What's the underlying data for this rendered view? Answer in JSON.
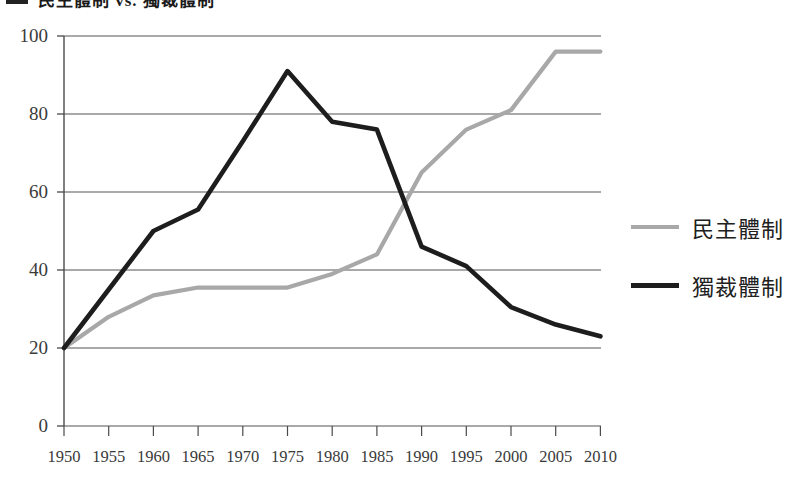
{
  "figure": {
    "title_partial": "民主體制 vs. 獨裁體制",
    "figure_marker": ""
  },
  "legend": {
    "position": "right",
    "entries": [
      {
        "label": "民主體制",
        "color": "#a8a8a8",
        "style": "gray"
      },
      {
        "label": "獨裁體制",
        "color": "#1d1d1d",
        "style": "black"
      }
    ]
  },
  "axes": {
    "y_ticks": [
      "100",
      "80",
      "60",
      "40",
      "20",
      "0"
    ],
    "x_ticks": [
      "1950",
      "1955",
      "1960",
      "1965",
      "1970",
      "1975",
      "1980",
      "1985",
      "1990",
      "1995",
      "2000",
      "2005",
      "2010"
    ]
  },
  "chart_data": {
    "type": "line",
    "title": "民主體制 vs. 獨裁體制",
    "xlabel": "",
    "ylabel": "",
    "x": [
      1950,
      1955,
      1960,
      1965,
      1970,
      1975,
      1980,
      1985,
      1990,
      1995,
      2000,
      2005,
      2010
    ],
    "categories": [
      "1950",
      "1955",
      "1960",
      "1965",
      "1970",
      "1975",
      "1980",
      "1985",
      "1990",
      "1995",
      "2000",
      "2005",
      "2010"
    ],
    "series": [
      {
        "name": "民主體制",
        "color": "#a8a8a8",
        "values": [
          20,
          28,
          33.5,
          35.5,
          35.5,
          35.5,
          39,
          44,
          65,
          76,
          81,
          96,
          96
        ]
      },
      {
        "name": "獨裁體制",
        "color": "#1d1d1d",
        "values": [
          20,
          35,
          50,
          55.5,
          73,
          91,
          78,
          76,
          46,
          41,
          30.5,
          26,
          23
        ]
      }
    ],
    "xlim": [
      1950,
      2010
    ],
    "ylim": [
      0,
      100
    ],
    "ytick_values": [
      0,
      20,
      40,
      60,
      80,
      100
    ],
    "grid": "horizontal",
    "legend_position": "right"
  }
}
